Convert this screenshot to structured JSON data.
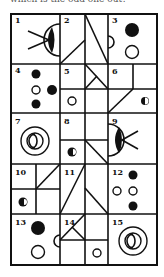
{
  "caption": "which is the odd one out?",
  "puzzle": {
    "type": "odd-one-out grid",
    "rows": 5,
    "columns": 3,
    "cells": [
      {
        "label": "1",
        "content": "eye shape (half circle with filled pupil) with two lines (arrow/whiskers) pointing right"
      },
      {
        "label": "2",
        "content": "split cell: diagonal line bottom-left to middle, diagonal line top-left to bottom-right in right half"
      },
      {
        "label": "3",
        "content": "filled circle top, open circle bottom, half circle on left edge"
      },
      {
        "label": "4",
        "content": "filled circle, open circle, filled circle, filled circle"
      },
      {
        "label": "5",
        "content": "2x2 subdivided cell with triangle lines top-right and open circle bottom-left"
      },
      {
        "label": "6",
        "content": "2x2 subdivided cell with diagonal bottom-left and half-filled circle bottom-right"
      },
      {
        "label": "7",
        "content": "concentric circles with inner split circle"
      },
      {
        "label": "8",
        "content": "2x2 subdivided cell with half-filled circle bottom-left and diagonal line bottom-right"
      },
      {
        "label": "9",
        "content": "eye shape facing left with two lines pointing right"
      },
      {
        "label": "10",
        "content": "2x2 subdivided cell with diagonal top-right and half-filled circle bottom-left"
      },
      {
        "label": "11",
        "content": "split cell: long diagonal left half, shorter diagonal right half"
      },
      {
        "label": "12",
        "content": "filled circle, two open circles, filled circle"
      },
      {
        "label": "13",
        "content": "filled circle top, open circle bottom, half circle on right edge"
      },
      {
        "label": "14",
        "content": "2x2 subdivided cell with crossed lines top-left and open circle bottom-right"
      },
      {
        "label": "15",
        "content": "concentric circles with inner split circle"
      }
    ]
  }
}
